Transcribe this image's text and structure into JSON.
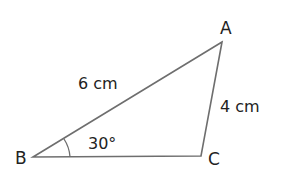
{
  "diagram": {
    "type": "triangle",
    "vertices": {
      "A": {
        "label": "A"
      },
      "B": {
        "label": "B"
      },
      "C": {
        "label": "C"
      }
    },
    "sides": {
      "AB": {
        "label": "6 cm"
      },
      "AC": {
        "label": "4 cm"
      }
    },
    "angles": {
      "B": {
        "label": "30°"
      }
    },
    "colors": {
      "stroke": "#6e6e6e",
      "text": "#222222",
      "background": "#ffffff"
    }
  }
}
